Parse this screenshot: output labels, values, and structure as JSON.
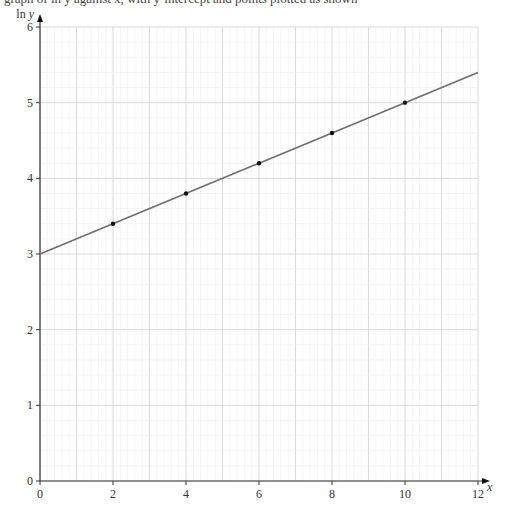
{
  "header_text_cutoff": "graph of ln y against x, with y-intercept and points plotted as shown",
  "chart_data": {
    "type": "scatter",
    "title": "",
    "xlabel": "x",
    "ylabel": "ln y",
    "xlim": [
      0,
      12
    ],
    "ylim": [
      0,
      6
    ],
    "x_ticks": [
      0,
      2,
      4,
      6,
      8,
      10,
      12
    ],
    "y_ticks": [
      0,
      1,
      2,
      3,
      4,
      5,
      6
    ],
    "grid": true,
    "grid_minor_step": 0.2,
    "points": [
      {
        "x": 2,
        "y": 3.4
      },
      {
        "x": 4,
        "y": 3.8
      },
      {
        "x": 6,
        "y": 4.2
      },
      {
        "x": 8,
        "y": 4.6
      },
      {
        "x": 10,
        "y": 5.0
      }
    ],
    "line": {
      "intercept": 3,
      "slope": 0.2,
      "x_range": [
        0,
        12
      ]
    },
    "colors": {
      "line": "#6e6e6e",
      "points": "#111111",
      "grid_minor": "#ececec",
      "grid_major": "#d6d6d6",
      "axes": "#333333"
    }
  }
}
